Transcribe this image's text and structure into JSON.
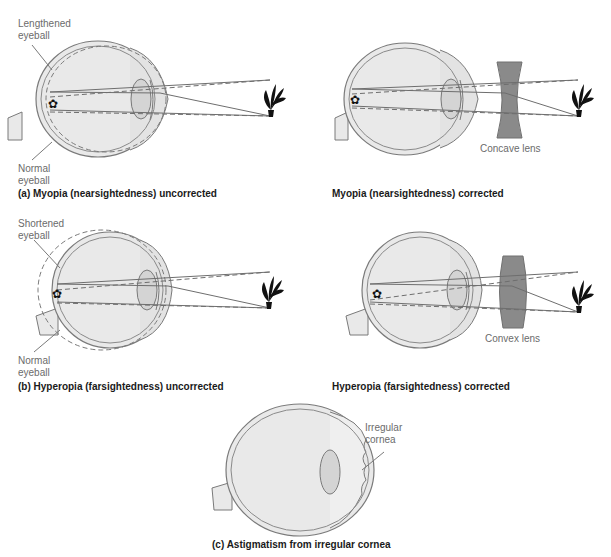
{
  "colors": {
    "eye_fill": "#e9e9e9",
    "eye_stroke": "#7a7a7a",
    "lens_fill": "#d4d4d4",
    "corrective_lens_fill": "#8a8a8a",
    "ray": "#6e6e6e",
    "label_text": "#6b6b6b",
    "caption_text": "#1a1a1a"
  },
  "panels": {
    "myopia_uncorrected": {
      "caption": "(a) Myopia (nearsightedness) uncorrected",
      "label_top": "Lengthened\neyeball",
      "label_bottom": "Normal\neyeball"
    },
    "myopia_corrected": {
      "caption": "Myopia (nearsightedness) corrected",
      "lens_label": "Concave lens"
    },
    "hyperopia_uncorrected": {
      "caption": "(b) Hyperopia (farsightedness) uncorrected",
      "label_top": "Shortened\neyeball",
      "label_bottom": "Normal\neyeball"
    },
    "hyperopia_corrected": {
      "caption": "Hyperopia (farsightedness) corrected",
      "lens_label": "Convex lens"
    },
    "astigmatism": {
      "caption": "(c) Astigmatism from irregular cornea",
      "label": "Irregular\ncornea"
    }
  }
}
